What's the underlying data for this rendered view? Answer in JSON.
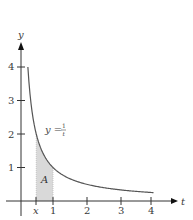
{
  "chart_data": {
    "type": "area",
    "title": "",
    "xlabel": "t",
    "ylabel": "y",
    "curve_label": "y = 1/t",
    "curve_label_parts": {
      "lhs": "y =",
      "num": "1",
      "den": "t"
    },
    "area_label": "A",
    "x_ticks": [
      {
        "value": 0.5,
        "label": "x"
      },
      {
        "value": 1,
        "label": "1"
      },
      {
        "value": 2,
        "label": "2"
      },
      {
        "value": 3,
        "label": "3"
      },
      {
        "value": 4,
        "label": "4"
      }
    ],
    "y_ticks": [
      {
        "value": 1,
        "label": "1"
      },
      {
        "value": 2,
        "label": "2"
      },
      {
        "value": 3,
        "label": "3"
      },
      {
        "value": 4,
        "label": "4"
      }
    ],
    "xlim": [
      -0.5,
      4.7
    ],
    "ylim": [
      -0.5,
      4.7
    ],
    "grid": false,
    "series": [
      {
        "name": "y = 1/t",
        "function": "1/t",
        "domain": [
          0.25,
          4
        ],
        "x": [
          0.25,
          0.3,
          0.4,
          0.5,
          0.6,
          0.75,
          1,
          1.5,
          2,
          2.5,
          3,
          3.5,
          4
        ],
        "y": [
          4,
          3.333,
          2.5,
          2,
          1.667,
          1.333,
          1,
          0.667,
          0.5,
          0.4,
          0.333,
          0.286,
          0.25
        ]
      }
    ],
    "shaded_region": {
      "label": "A",
      "from": 0.5,
      "to": 1,
      "under": "y = 1/t"
    },
    "colors": {
      "curve": "#555555",
      "shade": "#d9d9d9",
      "axis": "#333333"
    }
  }
}
